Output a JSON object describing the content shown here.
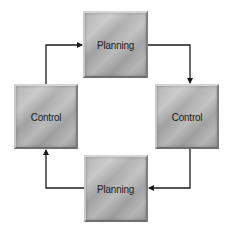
{
  "diagram": {
    "type": "cycle",
    "nodes": [
      {
        "id": "top",
        "label": "Planning",
        "x": 83,
        "y": 11,
        "w": 65,
        "h": 67
      },
      {
        "id": "right",
        "label": "Control",
        "x": 155,
        "y": 84,
        "w": 64,
        "h": 65
      },
      {
        "id": "bottom",
        "label": "Planning",
        "x": 84,
        "y": 155,
        "w": 64,
        "h": 67
      },
      {
        "id": "left",
        "label": "Control",
        "x": 14,
        "y": 84,
        "w": 64,
        "h": 65
      }
    ],
    "edges": [
      {
        "from": "left",
        "to": "top",
        "direction": "up-then-right"
      },
      {
        "from": "top",
        "to": "right",
        "direction": "right-then-down"
      },
      {
        "from": "right",
        "to": "bottom",
        "direction": "down-then-left"
      },
      {
        "from": "bottom",
        "to": "left",
        "direction": "left-then-up"
      }
    ],
    "colors": {
      "box_fill": "#a8a8a8",
      "text": "#1c1c1c",
      "arrow": "#1a1a1a",
      "background": "#ffffff"
    }
  }
}
